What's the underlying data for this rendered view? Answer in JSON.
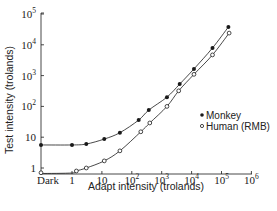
{
  "chart_data": {
    "type": "scatter",
    "title": "",
    "xlabel": "Adapt intensity (trolands)",
    "ylabel": "Test intensity (trolands)",
    "xscale": "log",
    "yscale": "log",
    "xlim": [
      0.1,
      1000000
    ],
    "ylim": [
      0.7,
      100000
    ],
    "x_ticks": [
      {
        "value": "dark",
        "label": "Dark"
      },
      {
        "value": 1,
        "label": "1"
      },
      {
        "value": 10,
        "label": "10"
      },
      {
        "value": 100,
        "label": "10^2"
      },
      {
        "value": 1000,
        "label": "10^3"
      },
      {
        "value": 10000,
        "label": "10^4"
      },
      {
        "value": 100000,
        "label": "10^5"
      },
      {
        "value": 1000000,
        "label": "10^6"
      }
    ],
    "y_ticks": [
      {
        "value": 1,
        "label": "1"
      },
      {
        "value": 10,
        "label": "10"
      },
      {
        "value": 100,
        "label": "10^2"
      },
      {
        "value": 1000,
        "label": "10^3"
      },
      {
        "value": 10000,
        "label": "10^4"
      },
      {
        "value": 100000,
        "label": "10^5"
      }
    ],
    "grid": false,
    "legend_position": "lower right (inside)",
    "series": [
      {
        "name": "Monkey",
        "marker": "filled circle",
        "with_fit_curve": true,
        "points": [
          {
            "x": "dark",
            "y": 5.6
          },
          {
            "x": 1,
            "y": 5.6
          },
          {
            "x": 3,
            "y": 6
          },
          {
            "x": 12,
            "y": 8.7
          },
          {
            "x": 40,
            "y": 14
          },
          {
            "x": 170,
            "y": 36
          },
          {
            "x": 370,
            "y": 76
          },
          {
            "x": 1500,
            "y": 200
          },
          {
            "x": 4000,
            "y": 530
          },
          {
            "x": 12000,
            "y": 1650
          },
          {
            "x": 50000,
            "y": 7900
          },
          {
            "x": 170000,
            "y": 38000
          }
        ]
      },
      {
        "name": "Human (RMB)",
        "marker": "open circle",
        "with_fit_curve": true,
        "points": [
          {
            "x": "dark",
            "y": 0.7
          },
          {
            "x": 1.4,
            "y": 0.8
          },
          {
            "x": 3,
            "y": 1
          },
          {
            "x": 12,
            "y": 1.7
          },
          {
            "x": 40,
            "y": 3.6
          },
          {
            "x": 200,
            "y": 15
          },
          {
            "x": 400,
            "y": 29
          },
          {
            "x": 1500,
            "y": 100
          },
          {
            "x": 3700,
            "y": 320
          },
          {
            "x": 12000,
            "y": 1100
          },
          {
            "x": 50000,
            "y": 4700
          },
          {
            "x": 180000,
            "y": 24000
          }
        ]
      }
    ]
  },
  "legend": {
    "monkey_label": "Monkey",
    "human_label": "Human (RMB)"
  },
  "axes": {
    "xlabel": "Adapt intensity (trolands)",
    "ylabel": "Test intensity (trolands)",
    "x_tick_labels": {
      "dark": "Dark",
      "t0": "1",
      "t1": "10",
      "base": "10"
    },
    "y_tick_labels": {
      "t0": "1",
      "t1": "10",
      "base": "10"
    }
  },
  "colors": {
    "ink": "#1a1a1a",
    "background": "#ffffff"
  }
}
